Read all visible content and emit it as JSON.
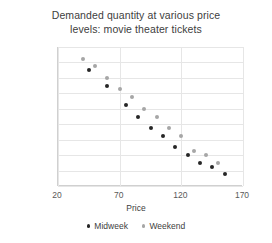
{
  "chart_data": {
    "type": "scatter",
    "title": "Demanded quantity at various price levels: movie theater tickets",
    "title_line1": "Demanded quantity at various price",
    "title_line2": "levels: movie theater tickets",
    "xlabel": "Price",
    "ylabel": "Demanded quantity (d(p))",
    "xlim": [
      20,
      170
    ],
    "ylim": [
      0,
      1800
    ],
    "xticks": [
      20,
      70,
      120,
      170
    ],
    "yticks": [
      0,
      200,
      400,
      600,
      800,
      1000,
      1200,
      1400,
      1600,
      1800
    ],
    "grid": true,
    "legend_position": "bottom",
    "colors": {
      "midweek": "#262626",
      "weekend": "#a6a6a6",
      "grid": "#e6e6e6",
      "axis": "#d0d0d0",
      "text": "#404040"
    },
    "series": [
      {
        "name": "Midweek",
        "color": "#262626",
        "points": [
          [
            45,
            1500
          ],
          [
            60,
            1300
          ],
          [
            75,
            1050
          ],
          [
            85,
            900
          ],
          [
            95,
            750
          ],
          [
            105,
            650
          ],
          [
            115,
            500
          ],
          [
            125,
            400
          ],
          [
            135,
            300
          ],
          [
            145,
            250
          ],
          [
            155,
            150
          ]
        ]
      },
      {
        "name": "Weekend",
        "color": "#a6a6a6",
        "points": [
          [
            40,
            1650
          ],
          [
            50,
            1550
          ],
          [
            60,
            1400
          ],
          [
            70,
            1250
          ],
          [
            80,
            1150
          ],
          [
            90,
            1000
          ],
          [
            100,
            900
          ],
          [
            110,
            750
          ],
          [
            120,
            650
          ],
          [
            130,
            450
          ],
          [
            140,
            400
          ],
          [
            150,
            300
          ]
        ]
      }
    ]
  },
  "legend": {
    "items": [
      {
        "label": "Midweek",
        "color": "#262626"
      },
      {
        "label": "Weekend",
        "color": "#a6a6a6"
      }
    ]
  }
}
